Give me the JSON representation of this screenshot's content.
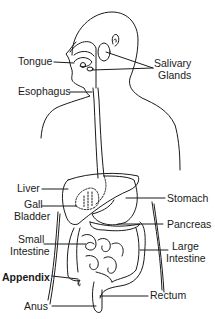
{
  "diagram": {
    "labels": {
      "tongue": "Tongue",
      "salivary_glands_1": "Salivary",
      "salivary_glands_2": "Glands",
      "esophagus": "Esophagus",
      "liver": "Liver",
      "gall_bladder_1": "Gall",
      "gall_bladder_2": "Bladder",
      "small_intestine_1": "Small",
      "small_intestine_2": "Intestine",
      "appendix": "Appendix",
      "anus": "Anus",
      "stomach": "Stomach",
      "pancreas": "Pancreas",
      "large_intestine_1": "Large",
      "large_intestine_2": "Intestine",
      "rectum": "Rectum"
    },
    "colors": {
      "line": "#1a1a1a",
      "background": "#ffffff"
    }
  }
}
